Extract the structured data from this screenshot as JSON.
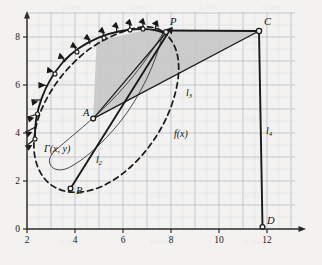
{
  "figure": {
    "background_color": "#f3f2f0",
    "grid_color": "#c9ccd2",
    "grid_minor_color": "#dcdee2",
    "axis_color": "#2b2b2b",
    "shade_color": "#c6c6c6",
    "ink_color": "#1a1a1a"
  },
  "axes": {
    "x_ticks": [
      "2",
      "4",
      "6",
      "8",
      "10",
      "12"
    ],
    "x_tick_values": [
      2,
      4,
      6,
      8,
      10,
      12
    ],
    "y_ticks": [
      "0",
      "2",
      "4",
      "6",
      "8"
    ],
    "y_tick_values": [
      0,
      2,
      4,
      6,
      8
    ],
    "x_range": [
      2,
      13.0
    ],
    "y_range": [
      0,
      9.3
    ],
    "grid_step": 0.5,
    "grid_on": true
  },
  "labels": {
    "P": "P",
    "C": "C",
    "D": "D",
    "A": "A",
    "B": "B",
    "gamma": "Γ(x, y)",
    "f": "f(x)",
    "l2": "l",
    "l2_sub": "2",
    "l3": "l",
    "l3_sub": "3",
    "l4": "l",
    "l4_sub": "4"
  },
  "points": {
    "P": [
      7.8,
      8.05
    ],
    "C": [
      11.68,
      8.0
    ],
    "D": [
      12.0,
      0.05
    ],
    "A": [
      5.52,
      4.62
    ],
    "B": [
      4.02,
      2.02
    ]
  },
  "curves": {
    "gamma_solid": {
      "name": "closed-curve-with-normals",
      "style": "solid",
      "description": "upper arc of closed curve carrying outward normal arrows"
    },
    "f_dashed": {
      "name": "f(x)",
      "style": "dashed",
      "description": "dashed closed oval curve"
    },
    "thin_inner": {
      "name": "inner-thin-curve",
      "style": "solid-thin"
    }
  },
  "normals": {
    "count": 14,
    "description": "outward arrows along the solid upper arc"
  },
  "shaded_region": {
    "description": "gray region bounded by A-P, P-C, C-A"
  }
}
